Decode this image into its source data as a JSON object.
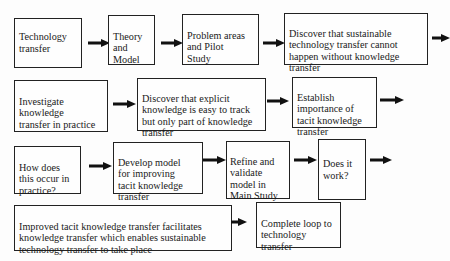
{
  "diagram": {
    "type": "flowchart",
    "rows": [
      {
        "steps": [
          {
            "id": "technology-transfer",
            "label": "Technology\ntransfer"
          },
          {
            "id": "theory-and-model",
            "label": "Theory\nand\nModel"
          },
          {
            "id": "problem-areas-pilot-study",
            "label": "Problem areas\nand Pilot\nStudy"
          },
          {
            "id": "discover-sustainable",
            "label": "Discover that sustainable\ntechnology transfer cannot\nhappen without knowledge\ntransfer"
          }
        ]
      },
      {
        "steps": [
          {
            "id": "investigate-knowledge-transfer",
            "label": "Investigate\nknowledge\ntransfer in practice"
          },
          {
            "id": "discover-explicit",
            "label": "Discover that explicit\nknowledge is easy to track\nbut only part of knowledge\ntransfer"
          },
          {
            "id": "establish-importance",
            "label": "Establish\nimportance of\ntacit knowledge\ntransfer"
          }
        ]
      },
      {
        "steps": [
          {
            "id": "how-does-this-occur",
            "label": "How does\nthis occur in\npractice?"
          },
          {
            "id": "develop-model",
            "label": "Develop model\nfor improving\ntacit knowledge\ntransfer"
          },
          {
            "id": "refine-validate",
            "label": "Refine and\nvalidate\nmodel in\nMain Study"
          },
          {
            "id": "does-it-work",
            "label": "Does it\nwork?"
          }
        ]
      },
      {
        "steps": [
          {
            "id": "improved-tacit",
            "label": "Improved tacit knowledge transfer facilitates\nknowledge transfer which enables sustainable\ntechnology transfer to take place"
          },
          {
            "id": "complete-loop",
            "label": "Complete loop to\ntechnology\ntransfer"
          }
        ]
      }
    ],
    "colors": {
      "box_border": "#222222",
      "arrow": "#111111",
      "background": "#fdfdfd"
    }
  }
}
